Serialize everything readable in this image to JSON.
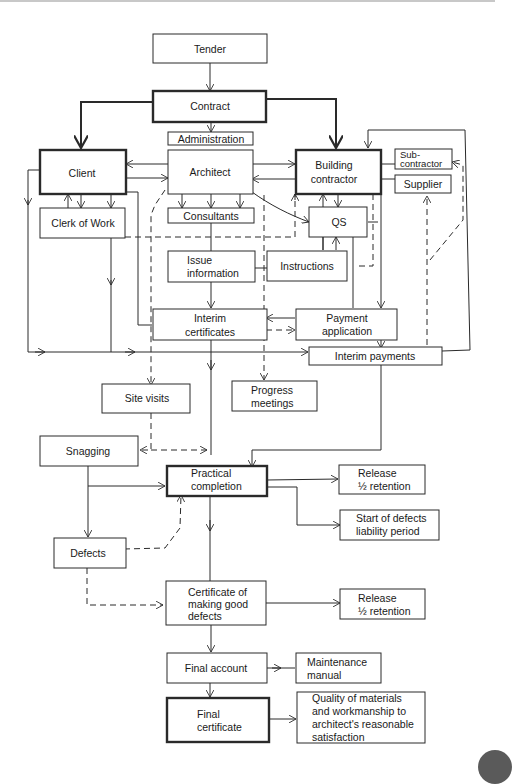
{
  "diagram": {
    "nodes": {
      "tender": {
        "lines": [
          "Tender"
        ]
      },
      "contract": {
        "lines": [
          "Contract"
        ]
      },
      "administration": {
        "lines": [
          "Administration"
        ]
      },
      "client": {
        "lines": [
          "Client"
        ]
      },
      "architect": {
        "lines": [
          "Architect"
        ]
      },
      "building_contractor": {
        "lines": [
          "Building",
          "contractor"
        ]
      },
      "subcontractor": {
        "lines": [
          "Sub-",
          "contractor"
        ]
      },
      "supplier": {
        "lines": [
          "Supplier"
        ]
      },
      "clerk_of_work": {
        "lines": [
          "Clerk of Work"
        ]
      },
      "consultants": {
        "lines": [
          "Consultants"
        ]
      },
      "qs": {
        "lines": [
          "QS"
        ]
      },
      "issue_information": {
        "lines": [
          "Issue",
          "information"
        ]
      },
      "instructions": {
        "lines": [
          "Instructions"
        ]
      },
      "interim_certificates": {
        "lines": [
          "Interim",
          "certificates"
        ]
      },
      "payment_application": {
        "lines": [
          "Payment",
          "application"
        ]
      },
      "interim_payments": {
        "lines": [
          "Interim payments"
        ]
      },
      "site_visits": {
        "lines": [
          "Site visits"
        ]
      },
      "progress_meetings": {
        "lines": [
          "Progress",
          "meetings"
        ]
      },
      "snagging": {
        "lines": [
          "Snagging"
        ]
      },
      "practical_completion": {
        "lines": [
          "Practical",
          "completion"
        ]
      },
      "release_retention_1": {
        "lines": [
          "Release",
          "½ retention"
        ]
      },
      "start_defects_liability": {
        "lines": [
          "Start of defects",
          "liability period"
        ]
      },
      "defects": {
        "lines": [
          "Defects"
        ]
      },
      "certificate_making_good": {
        "lines": [
          "Certificate of",
          "making good",
          "defects"
        ]
      },
      "release_retention_2": {
        "lines": [
          "Release",
          "½ retention"
        ]
      },
      "final_account": {
        "lines": [
          "Final account"
        ]
      },
      "maintenance_manual": {
        "lines": [
          "Maintenance",
          "manual"
        ]
      },
      "final_certificate": {
        "lines": [
          "Final",
          "certificate"
        ]
      },
      "quality_materials": {
        "lines": [
          "Quality of materials",
          "and workmanship to",
          "architect's reasonable",
          "satisfaction"
        ]
      }
    }
  }
}
